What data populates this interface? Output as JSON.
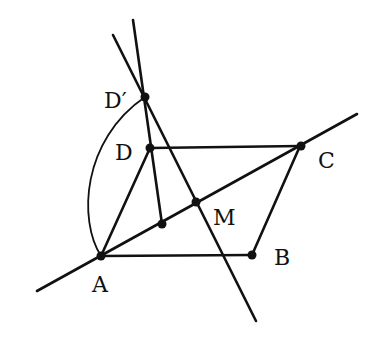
{
  "figure": {
    "ink_color": "#111111",
    "background_color": "#ffffff",
    "points": {
      "A": "A",
      "B": "B",
      "C": "C",
      "D": "D",
      "D_prime": "D′",
      "M": "M"
    },
    "segments": [
      "AB",
      "BC",
      "CD",
      "DA",
      "line AC (extended)",
      "line D′M (extended)",
      "line D′D (extended)"
    ],
    "arc": "arc A–D′"
  }
}
